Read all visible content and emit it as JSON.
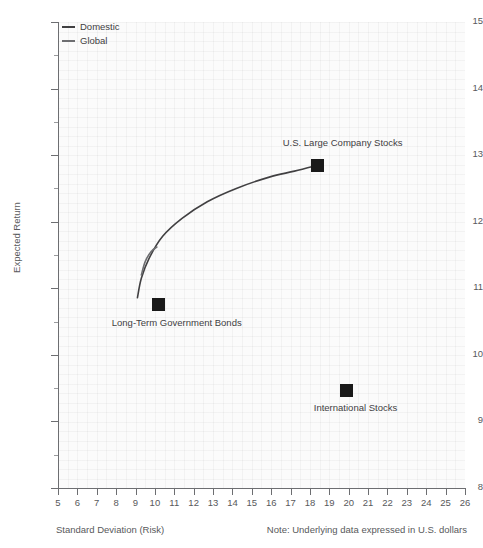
{
  "chart_data": {
    "type": "scatter",
    "title": "",
    "xlabel": "Standard Deviation (Risk)",
    "ylabel": "Expected Return",
    "xlim": [
      5,
      26
    ],
    "ylim": [
      8,
      15
    ],
    "grid": true,
    "legend_position": "top-left",
    "note": "Note: Underlying data expressed in U.S. dollars",
    "xticks": [
      "5",
      "6",
      "7",
      "8",
      "9",
      "10",
      "11",
      "12",
      "13",
      "14",
      "15",
      "16",
      "17",
      "18",
      "19",
      "20",
      "21",
      "22",
      "23",
      "24",
      "25",
      "26"
    ],
    "yticks": [
      "8",
      "9",
      "10",
      "11",
      "12",
      "13",
      "14",
      "15"
    ],
    "yticks_minor": [
      8.5,
      9.5,
      10.5,
      11.5,
      12.5,
      13.5,
      14.5
    ],
    "legend": [
      {
        "name": "Domestic",
        "color": "#414042"
      },
      {
        "name": "Global",
        "color": "#6d6e71"
      }
    ],
    "points": [
      {
        "label": "Long-Term Government Bonds",
        "x": 10.2,
        "y": 10.75,
        "color": "#1a1a1a"
      },
      {
        "label": "U.S. Large Company Stocks",
        "x": 18.4,
        "y": 12.85,
        "color": "#1a1a1a"
      },
      {
        "label": "International Stocks",
        "x": 19.9,
        "y": 9.47,
        "color": "#1a1a1a"
      }
    ],
    "series": [
      {
        "name": "Domestic",
        "color": "#414042",
        "x": [
          9.1,
          9.3,
          9.7,
          10.4,
          11.4,
          12.7,
          14.2,
          15.9,
          17.2,
          18.4
        ],
        "y": [
          10.86,
          11.15,
          11.45,
          11.78,
          12.05,
          12.3,
          12.5,
          12.67,
          12.76,
          12.85
        ]
      },
      {
        "name": "Global",
        "color": "#6d6e71",
        "x": [
          9.3,
          9.5,
          9.8,
          10.1
        ],
        "y": [
          11.2,
          11.4,
          11.55,
          11.62
        ]
      }
    ]
  }
}
